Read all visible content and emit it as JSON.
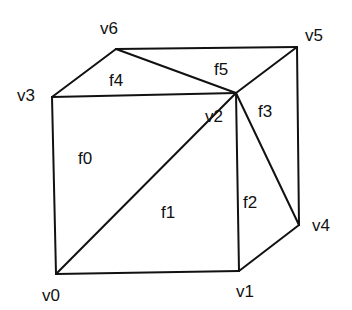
{
  "diagram": {
    "type": "triangulated cube mesh",
    "vertices": [
      {
        "id": "v0",
        "label": "v0",
        "x": 56,
        "y": 274,
        "lx": 42,
        "ly": 301
      },
      {
        "id": "v1",
        "label": "v1",
        "x": 239,
        "y": 271,
        "lx": 236,
        "ly": 297
      },
      {
        "id": "v2",
        "label": "v2",
        "x": 236,
        "y": 93,
        "lx": 205,
        "ly": 122
      },
      {
        "id": "v3",
        "label": "v3",
        "x": 52,
        "y": 97,
        "lx": 17,
        "ly": 101
      },
      {
        "id": "v4",
        "label": "v4",
        "x": 299,
        "y": 225,
        "lx": 312,
        "ly": 231
      },
      {
        "id": "v5",
        "label": "v5",
        "x": 297,
        "y": 47,
        "lx": 305,
        "ly": 41
      },
      {
        "id": "v6",
        "label": "v6",
        "x": 116,
        "y": 49,
        "lx": 100,
        "ly": 34
      }
    ],
    "edges": [
      [
        "v0",
        "v1"
      ],
      [
        "v0",
        "v3"
      ],
      [
        "v0",
        "v2"
      ],
      [
        "v3",
        "v2"
      ],
      [
        "v1",
        "v2"
      ],
      [
        "v1",
        "v4"
      ],
      [
        "v4",
        "v5"
      ],
      [
        "v2",
        "v4"
      ],
      [
        "v2",
        "v5"
      ],
      [
        "v6",
        "v5"
      ],
      [
        "v6",
        "v2"
      ],
      [
        "v3",
        "v6"
      ]
    ],
    "faces": [
      {
        "id": "f0",
        "label": "f0",
        "x": 85,
        "y": 164
      },
      {
        "id": "f1",
        "label": "f1",
        "x": 168,
        "y": 218
      },
      {
        "id": "f2",
        "label": "f2",
        "x": 250,
        "y": 208
      },
      {
        "id": "f3",
        "label": "f3",
        "x": 265,
        "y": 117
      },
      {
        "id": "f4",
        "label": "f4",
        "x": 116,
        "y": 86
      },
      {
        "id": "f5",
        "label": "f5",
        "x": 221,
        "y": 75
      }
    ],
    "colors": {
      "stroke": "#111111",
      "background": "#ffffff",
      "text": "#111111"
    }
  }
}
